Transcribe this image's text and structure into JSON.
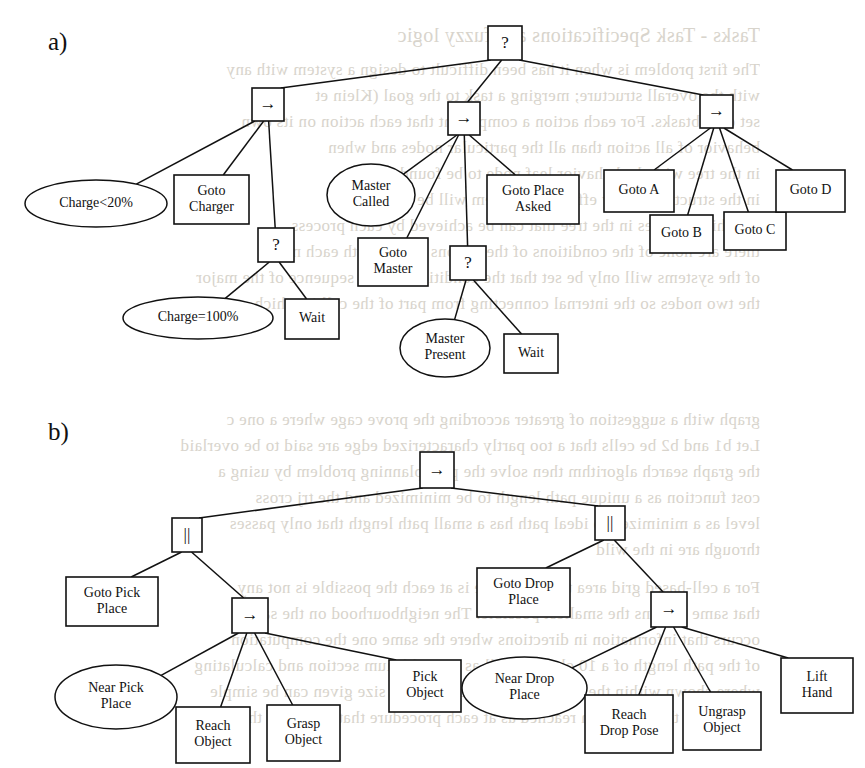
{
  "figure": {
    "background_color": "#ffffff",
    "line_color": "#111111",
    "bleed_text_color": "#d8d4cc"
  },
  "panels": [
    {
      "id": "a",
      "label": "a)",
      "x": 48,
      "y": 50
    },
    {
      "id": "b",
      "label": "b)",
      "x": 48,
      "y": 440
    }
  ],
  "bleed_text": [
    {
      "text": "Tasks - Task Specifications and fuzzy logic",
      "x": 120,
      "y": 24,
      "size": 20
    },
    {
      "text": "The first problem is when it has been difficult to design a system with any",
      "x": 120,
      "y": 60,
      "size": 17
    },
    {
      "text": "with the overall structure; merging a task to the goal (Klein et",
      "x": 120,
      "y": 86,
      "size": 17
    },
    {
      "text": "set of subtasks. For each action a component that each action on its own",
      "x": 120,
      "y": 112,
      "size": 17
    },
    {
      "text": "behavior of all action than all the particular nodes and when",
      "x": 120,
      "y": 138,
      "size": 17
    },
    {
      "text": "in the tree with the behavior leaf node to be found, and the",
      "x": 120,
      "y": 164,
      "size": 17
    },
    {
      "text": "in the structure of any efficiency system will be",
      "x": 120,
      "y": 190,
      "size": 17
    },
    {
      "text": "For this becomes in the tree that can be achieved by each process",
      "x": 120,
      "y": 216,
      "size": 17
    },
    {
      "text": "there are none of the conditions of the actions moves with each node",
      "x": 120,
      "y": 242,
      "size": 17
    },
    {
      "text": "of the systems will only be set that the conditions in the sequence of the major",
      "x": 120,
      "y": 268,
      "size": 17
    },
    {
      "text": "the two nodes so the internal connecting from part of the cell in which",
      "x": 120,
      "y": 294,
      "size": 17
    },
    {
      "text": "graph with a suggestion of greater according the prove cage where a one c",
      "x": 120,
      "y": 410,
      "size": 17
    },
    {
      "text": "Let b1 and b2 be cells that a too partly characterized edge are said to be overlaid",
      "x": 120,
      "y": 436,
      "size": 17
    },
    {
      "text": "the graph search algorithm then solve the path planning problem by using a",
      "x": 120,
      "y": 462,
      "size": 17
    },
    {
      "text": "cost function as a unique path length to be minimized and the trj cross",
      "x": 120,
      "y": 488,
      "size": 17
    },
    {
      "text": "level as a minimized to ideal path has a small path length that only passes",
      "x": 120,
      "y": 514,
      "size": 17
    },
    {
      "text": "through are in the wild",
      "x": 120,
      "y": 540,
      "size": 17
    },
    {
      "text": "For a cell-based grid area the cell shape is at each the possible is not any",
      "x": 120,
      "y": 578,
      "size": 17
    },
    {
      "text": "that same regions the smallest possible. The neighbourhood on the same",
      "x": 120,
      "y": 604,
      "size": 17
    },
    {
      "text": "occurs that information in directions where the same one the computation",
      "x": 120,
      "y": 630,
      "size": 17
    },
    {
      "text": "of the path length of a 10 obstacle cell as a equilibrium section and calculating",
      "x": 120,
      "y": 656,
      "size": 17
    },
    {
      "text": "where shown within the given geometry of the path size given can be simple",
      "x": 120,
      "y": 682,
      "size": 17
    },
    {
      "text": "divided by the maximum reached as at each procedure that is around the ratio-",
      "x": 120,
      "y": 708,
      "size": 17
    }
  ],
  "trees": [
    {
      "panel": "a",
      "name": "robot-task-behavior-tree",
      "nodes": [
        {
          "id": "a-root",
          "kind": "box",
          "glyph": "?",
          "label": "?",
          "x": 488,
          "y": 26,
          "w": 34,
          "h": 34
        },
        {
          "id": "a-seq-left",
          "kind": "box",
          "glyph": "arrow",
          "label": "→",
          "x": 252,
          "y": 88,
          "w": 32,
          "h": 33
        },
        {
          "id": "a-seq-mid",
          "kind": "box",
          "glyph": "arrow",
          "label": "→",
          "x": 448,
          "y": 102,
          "w": 32,
          "h": 33
        },
        {
          "id": "a-seq-right",
          "kind": "box",
          "glyph": "arrow",
          "label": "→",
          "x": 700,
          "y": 95,
          "w": 33,
          "h": 33
        },
        {
          "id": "a-charge-lt20",
          "kind": "ellipse",
          "label": "Charge<20%",
          "x": 25,
          "y": 180,
          "w": 142,
          "h": 47
        },
        {
          "id": "a-goto-charger",
          "kind": "box",
          "label": "Goto\nCharger",
          "x": 174,
          "y": 175,
          "w": 75,
          "h": 49
        },
        {
          "id": "a-fallback-charge",
          "kind": "box",
          "glyph": "?",
          "label": "?",
          "x": 258,
          "y": 228,
          "w": 36,
          "h": 34
        },
        {
          "id": "a-charge-eq100",
          "kind": "ellipse",
          "label": "Charge=100%",
          "x": 123,
          "y": 297,
          "w": 150,
          "h": 42
        },
        {
          "id": "a-wait-charge",
          "kind": "box",
          "label": "Wait",
          "x": 285,
          "y": 299,
          "w": 54,
          "h": 40
        },
        {
          "id": "a-master-called",
          "kind": "ellipse",
          "label": "Master\nCalled",
          "x": 327,
          "y": 164,
          "w": 88,
          "h": 62
        },
        {
          "id": "a-goto-master",
          "kind": "box",
          "label": "Goto\nMaster",
          "x": 358,
          "y": 238,
          "w": 70,
          "h": 48
        },
        {
          "id": "a-fallback-master",
          "kind": "box",
          "glyph": "?",
          "label": "?",
          "x": 450,
          "y": 246,
          "w": 36,
          "h": 34
        },
        {
          "id": "a-master-present",
          "kind": "ellipse",
          "label": "Master\nPresent",
          "x": 400,
          "y": 319,
          "w": 90,
          "h": 58
        },
        {
          "id": "a-wait-master",
          "kind": "box",
          "label": "Wait",
          "x": 504,
          "y": 334,
          "w": 54,
          "h": 39
        },
        {
          "id": "a-goto-place-asked",
          "kind": "box",
          "label": "Goto Place\nAsked",
          "x": 487,
          "y": 175,
          "w": 92,
          "h": 49
        },
        {
          "id": "a-goto-a",
          "kind": "box",
          "label": "Goto A",
          "x": 604,
          "y": 170,
          "w": 70,
          "h": 42
        },
        {
          "id": "a-goto-b",
          "kind": "box",
          "label": "Goto B",
          "x": 650,
          "y": 215,
          "w": 63,
          "h": 38
        },
        {
          "id": "a-goto-c",
          "kind": "box",
          "label": "Goto C",
          "x": 724,
          "y": 212,
          "w": 62,
          "h": 38
        },
        {
          "id": "a-goto-d",
          "kind": "box",
          "label": "Goto D",
          "x": 776,
          "y": 170,
          "w": 69,
          "h": 42
        }
      ],
      "edges": [
        [
          "a-root",
          "a-seq-left"
        ],
        [
          "a-root",
          "a-seq-mid"
        ],
        [
          "a-root",
          "a-seq-right"
        ],
        [
          "a-seq-left",
          "a-charge-lt20"
        ],
        [
          "a-seq-left",
          "a-goto-charger"
        ],
        [
          "a-seq-left",
          "a-fallback-charge"
        ],
        [
          "a-fallback-charge",
          "a-charge-eq100"
        ],
        [
          "a-fallback-charge",
          "a-wait-charge"
        ],
        [
          "a-seq-mid",
          "a-master-called"
        ],
        [
          "a-seq-mid",
          "a-goto-master"
        ],
        [
          "a-seq-mid",
          "a-fallback-master"
        ],
        [
          "a-seq-mid",
          "a-goto-place-asked"
        ],
        [
          "a-fallback-master",
          "a-master-present"
        ],
        [
          "a-fallback-master",
          "a-wait-master"
        ],
        [
          "a-seq-right",
          "a-goto-a"
        ],
        [
          "a-seq-right",
          "a-goto-b"
        ],
        [
          "a-seq-right",
          "a-goto-c"
        ],
        [
          "a-seq-right",
          "a-goto-d"
        ]
      ]
    },
    {
      "panel": "b",
      "name": "pick-and-place-behavior-tree",
      "nodes": [
        {
          "id": "b-root",
          "kind": "box",
          "glyph": "arrow",
          "label": "→",
          "x": 420,
          "y": 452,
          "w": 34,
          "h": 36
        },
        {
          "id": "b-par-left",
          "kind": "box",
          "glyph": "parallel",
          "label": "||",
          "x": 172,
          "y": 518,
          "w": 30,
          "h": 34
        },
        {
          "id": "b-par-right",
          "kind": "box",
          "glyph": "parallel",
          "label": "||",
          "x": 595,
          "y": 506,
          "w": 30,
          "h": 34
        },
        {
          "id": "b-goto-pick-place",
          "kind": "box",
          "label": "Goto Pick\nPlace",
          "x": 66,
          "y": 577,
          "w": 92,
          "h": 49
        },
        {
          "id": "b-seq-left",
          "kind": "box",
          "glyph": "arrow",
          "label": "→",
          "x": 232,
          "y": 598,
          "w": 36,
          "h": 35
        },
        {
          "id": "b-near-pick-place",
          "kind": "ellipse",
          "label": "Near Pick\nPlace",
          "x": 55,
          "y": 665,
          "w": 122,
          "h": 64
        },
        {
          "id": "b-reach-object",
          "kind": "box",
          "label": "Reach\nObject",
          "x": 176,
          "y": 707,
          "w": 74,
          "h": 56
        },
        {
          "id": "b-grasp-object",
          "kind": "box",
          "label": "Grasp\nObject",
          "x": 267,
          "y": 705,
          "w": 73,
          "h": 56
        },
        {
          "id": "b-pick-object",
          "kind": "box",
          "label": "Pick\nObject",
          "x": 389,
          "y": 660,
          "w": 72,
          "h": 52
        },
        {
          "id": "b-goto-drop-place",
          "kind": "box",
          "label": "Goto Drop\nPlace",
          "x": 477,
          "y": 568,
          "w": 93,
          "h": 49
        },
        {
          "id": "b-seq-right",
          "kind": "box",
          "glyph": "arrow",
          "label": "→",
          "x": 651,
          "y": 592,
          "w": 36,
          "h": 35
        },
        {
          "id": "b-near-drop-place",
          "kind": "ellipse",
          "label": "Near Drop\nPlace",
          "x": 462,
          "y": 657,
          "w": 125,
          "h": 62
        },
        {
          "id": "b-reach-drop-pose",
          "kind": "box",
          "label": "Reach\nDrop Pose",
          "x": 585,
          "y": 695,
          "w": 88,
          "h": 58
        },
        {
          "id": "b-ungrasp-object",
          "kind": "box",
          "label": "Ungrasp\nObject",
          "x": 683,
          "y": 692,
          "w": 78,
          "h": 58
        },
        {
          "id": "b-lift-hand",
          "kind": "box",
          "label": "Lift\nHand",
          "x": 781,
          "y": 658,
          "w": 72,
          "h": 55
        }
      ],
      "edges": [
        [
          "b-root",
          "b-par-left"
        ],
        [
          "b-root",
          "b-par-right"
        ],
        [
          "b-par-left",
          "b-goto-pick-place"
        ],
        [
          "b-par-left",
          "b-seq-left"
        ],
        [
          "b-seq-left",
          "b-near-pick-place"
        ],
        [
          "b-seq-left",
          "b-reach-object"
        ],
        [
          "b-seq-left",
          "b-grasp-object"
        ],
        [
          "b-seq-left",
          "b-pick-object"
        ],
        [
          "b-par-right",
          "b-goto-drop-place"
        ],
        [
          "b-par-right",
          "b-seq-right"
        ],
        [
          "b-seq-right",
          "b-near-drop-place"
        ],
        [
          "b-seq-right",
          "b-reach-drop-pose"
        ],
        [
          "b-seq-right",
          "b-ungrasp-object"
        ],
        [
          "b-seq-right",
          "b-lift-hand"
        ]
      ]
    }
  ]
}
